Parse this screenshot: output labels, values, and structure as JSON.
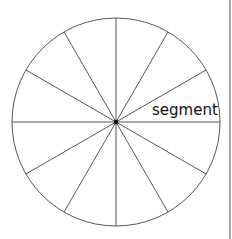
{
  "diagram": {
    "label": "segment",
    "segments": 12,
    "center": {
      "x": 116,
      "y": 122
    },
    "radius": 104,
    "colors": {
      "stroke": "#555555",
      "center_dot": "#111111",
      "label": "#111111",
      "edge_line": "#a8a8a8"
    }
  }
}
